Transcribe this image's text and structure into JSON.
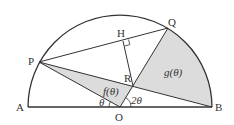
{
  "diagram": {
    "labels": {
      "A": "A",
      "B": "B",
      "O": "O",
      "P": "P",
      "Q": "Q",
      "H": "H",
      "R": "R",
      "f": "f(θ)",
      "g": "g(θ)",
      "theta": "θ",
      "two_theta": "2θ"
    },
    "colors": {
      "stroke": "#333333",
      "shade": "#dcdcdc",
      "background": "#ffffff"
    }
  }
}
